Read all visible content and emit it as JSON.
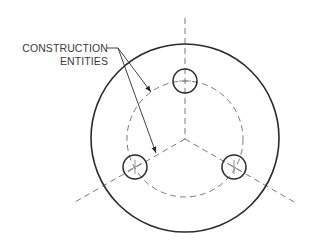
{
  "diagram": {
    "type": "technical-drawing",
    "callout": {
      "line1": "CONSTRUCTION",
      "line2": "ENTITIES"
    },
    "geometry": {
      "center": [
        185,
        139
      ],
      "outer_circle_radius": 94,
      "bolt_circle_radius": 58,
      "hole_radius": 12,
      "holes": [
        [
          185,
          81
        ],
        [
          135,
          168
        ],
        [
          235,
          168
        ]
      ]
    },
    "colors": {
      "solid_line": "#2a2a2a",
      "dashed_line": "#7a7a7a",
      "text": "#3a3a3a"
    }
  }
}
